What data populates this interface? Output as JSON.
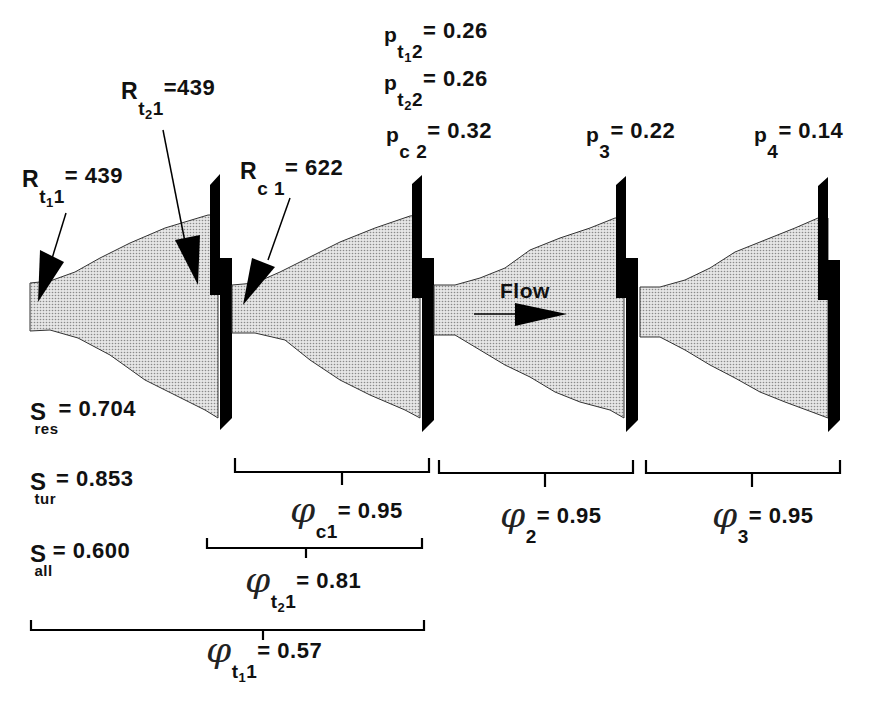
{
  "figure": {
    "flow_label": "Flow",
    "resistances": [
      {
        "symbol": "R",
        "sub": "t",
        "sub2": "1",
        "sub3": "1",
        "text": "= 439"
      },
      {
        "symbol": "R",
        "sub": "t",
        "sub2": "2",
        "sub3": "1",
        "text": "=439"
      },
      {
        "symbol": "R",
        "sub": "c 1",
        "text": "= 622"
      }
    ],
    "pressures": [
      {
        "symbol": "p",
        "sub": "t",
        "sub2": "1",
        "sub3": "2",
        "text": "= 0.26"
      },
      {
        "symbol": "p",
        "sub": "t",
        "sub2": "2",
        "sub3": "2",
        "text": "= 0.26"
      },
      {
        "symbol": "p",
        "sub": "c 2",
        "text": "= 0.32"
      },
      {
        "symbol": "p",
        "sub": "3",
        "text": "= 0.22"
      },
      {
        "symbol": "p",
        "sub": "4",
        "text": "= 0.14"
      }
    ],
    "efficiencies": [
      {
        "symbol": "S",
        "sub": "res",
        "text": "= 0.704"
      },
      {
        "symbol": "S",
        "sub": "tur",
        "text": "= 0.853"
      },
      {
        "symbol": "S",
        "sub": "all",
        "text": "= 0.600"
      }
    ],
    "phi_symbol": "φ",
    "phis": [
      {
        "sub": "c1",
        "text": "= 0.95"
      },
      {
        "sub": "2",
        "text": "= 0.95"
      },
      {
        "sub": "3",
        "text": "= 0.95"
      },
      {
        "sub": "t",
        "sub2": "2",
        "sub3": "1",
        "text": "= 0.81"
      },
      {
        "sub": "t",
        "sub2": "1",
        "sub3": "1",
        "text": "= 0.57"
      }
    ],
    "colors": {
      "fill": "#d4d4d4",
      "outline": "#333333",
      "plate": "#000000",
      "text": "#111111"
    }
  }
}
